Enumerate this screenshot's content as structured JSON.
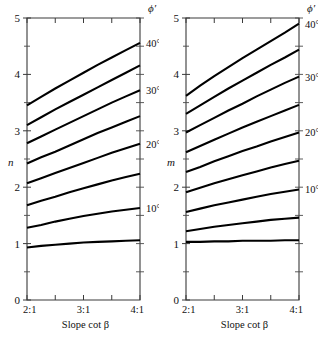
{
  "figure": {
    "background": "#ffffff",
    "line_color": "#000000",
    "axis_color": "#3a3a3a"
  },
  "chart_data": [
    {
      "type": "line",
      "panel": "left",
      "title": "",
      "xlabel": "Slope cot β",
      "ylabel": "n",
      "legend_title": "ϕ′",
      "legend_position": "right-edge",
      "grid": false,
      "xlim": [
        2,
        4
      ],
      "ylim": [
        0,
        5
      ],
      "x_tick_labels": [
        "2:1",
        "3:1",
        "4:1"
      ],
      "x_ticks": [
        2,
        3,
        4
      ],
      "x_minor_ticks": [
        2.5,
        3.5
      ],
      "y_ticks": [
        0,
        1,
        2,
        3,
        4,
        5
      ],
      "y_tick_labels": [
        "0",
        "1",
        "2",
        "3",
        "4",
        "5"
      ],
      "y_minor_ticks": [
        0.5,
        1.5,
        2.5,
        3.5,
        4.5
      ],
      "x": [
        2.0,
        2.25,
        2.5,
        2.75,
        3.0,
        3.25,
        3.5,
        3.75,
        4.0
      ],
      "series": [
        {
          "name": "40°",
          "label": "40°",
          "label_visible": true,
          "values": [
            3.45,
            3.6,
            3.75,
            3.89,
            4.03,
            4.17,
            4.3,
            4.43,
            4.56
          ]
        },
        {
          "name": "35°",
          "label": "35°",
          "label_visible": false,
          "values": [
            3.1,
            3.24,
            3.38,
            3.51,
            3.64,
            3.77,
            3.9,
            4.03,
            4.16
          ]
        },
        {
          "name": "30°",
          "label": "30°",
          "label_visible": true,
          "values": [
            2.78,
            2.9,
            3.02,
            3.14,
            3.26,
            3.38,
            3.5,
            3.61,
            3.72
          ]
        },
        {
          "name": "25°",
          "label": "25°",
          "label_visible": false,
          "values": [
            2.42,
            2.53,
            2.63,
            2.74,
            2.85,
            2.96,
            3.06,
            3.16,
            3.26
          ]
        },
        {
          "name": "20°",
          "label": "20°",
          "label_visible": true,
          "values": [
            2.07,
            2.16,
            2.25,
            2.34,
            2.43,
            2.52,
            2.61,
            2.69,
            2.77
          ]
        },
        {
          "name": "15°",
          "label": "15°",
          "label_visible": false,
          "values": [
            1.68,
            1.76,
            1.83,
            1.91,
            1.98,
            2.05,
            2.12,
            2.18,
            2.24
          ]
        },
        {
          "name": "10°",
          "label": "10°",
          "label_visible": true,
          "values": [
            1.28,
            1.33,
            1.39,
            1.44,
            1.49,
            1.53,
            1.57,
            1.6,
            1.63
          ]
        },
        {
          "name": "5°",
          "label": "5°",
          "label_visible": false,
          "values": [
            0.93,
            0.96,
            0.98,
            1.0,
            1.02,
            1.03,
            1.04,
            1.05,
            1.06
          ]
        }
      ]
    },
    {
      "type": "line",
      "panel": "right",
      "title": "",
      "xlabel": "Slope cot β",
      "ylabel": "m",
      "legend_title": "ϕ′",
      "legend_position": "right-edge",
      "grid": false,
      "xlim": [
        2,
        4
      ],
      "ylim": [
        0,
        5
      ],
      "x_tick_labels": [
        "2:1",
        "3:1",
        "4:1"
      ],
      "x_ticks": [
        2,
        3,
        4
      ],
      "x_minor_ticks": [
        2.5,
        3.5
      ],
      "y_ticks": [
        0,
        1,
        2,
        3,
        4,
        5
      ],
      "y_tick_labels": [
        "0",
        "1",
        "2",
        "3",
        "4",
        "5"
      ],
      "y_minor_ticks": [
        0.5,
        1.5,
        2.5,
        3.5,
        4.5
      ],
      "x": [
        2.0,
        2.25,
        2.5,
        2.75,
        3.0,
        3.25,
        3.5,
        3.75,
        4.0
      ],
      "series": [
        {
          "name": "40°",
          "label": "40°",
          "label_visible": true,
          "values": [
            3.62,
            3.8,
            3.97,
            4.13,
            4.29,
            4.44,
            4.59,
            4.74,
            4.9
          ]
        },
        {
          "name": "35°",
          "label": "35°",
          "label_visible": false,
          "values": [
            3.3,
            3.45,
            3.6,
            3.75,
            3.89,
            4.03,
            4.17,
            4.3,
            4.44
          ]
        },
        {
          "name": "30°",
          "label": "30°",
          "label_visible": true,
          "values": [
            2.97,
            3.1,
            3.23,
            3.36,
            3.48,
            3.61,
            3.73,
            3.85,
            3.96
          ]
        },
        {
          "name": "25°",
          "label": "25°",
          "label_visible": false,
          "values": [
            2.62,
            2.73,
            2.84,
            2.95,
            3.06,
            3.16,
            3.26,
            3.36,
            3.46
          ]
        },
        {
          "name": "20°",
          "label": "20°",
          "label_visible": true,
          "values": [
            2.27,
            2.36,
            2.46,
            2.55,
            2.64,
            2.72,
            2.81,
            2.89,
            2.97
          ]
        },
        {
          "name": "15°",
          "label": "15°",
          "label_visible": false,
          "values": [
            1.91,
            1.99,
            2.07,
            2.14,
            2.21,
            2.28,
            2.35,
            2.41,
            2.47
          ]
        },
        {
          "name": "10°",
          "label": "10°",
          "label_visible": true,
          "values": [
            1.56,
            1.62,
            1.68,
            1.73,
            1.78,
            1.83,
            1.88,
            1.92,
            1.96
          ]
        },
        {
          "name": "5°",
          "label": "5°",
          "label_visible": false,
          "values": [
            1.22,
            1.26,
            1.3,
            1.33,
            1.36,
            1.39,
            1.42,
            1.44,
            1.46
          ]
        },
        {
          "name": "0°",
          "label": "0°",
          "label_visible": false,
          "values": [
            1.03,
            1.03,
            1.04,
            1.04,
            1.05,
            1.05,
            1.05,
            1.06,
            1.06
          ]
        }
      ]
    }
  ]
}
